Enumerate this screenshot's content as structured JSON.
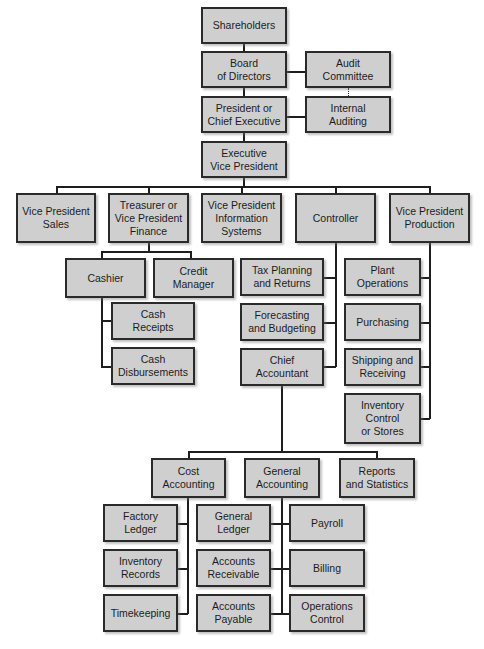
{
  "diagram": {
    "type": "organization-chart",
    "box_color": "#cfcfcf",
    "border_color": "#2a2a2a",
    "nodes": {
      "shareholders": "Shareholders",
      "board": "Board\nof Directors",
      "audit_committee": "Audit\nCommittee",
      "president": "President or\nChief Executive",
      "internal_auditing": "Internal\nAuditing",
      "exec_vp": "Executive\nVice President",
      "vp_sales": "Vice President\nSales",
      "treasurer": "Treasurer or\nVice President\nFinance",
      "vp_is": "Vice President\nInformation\nSystems",
      "controller": "Controller",
      "vp_production": "Vice President\nProduction",
      "cashier": "Cashier",
      "credit_manager": "Credit\nManager",
      "cash_receipts": "Cash\nReceipts",
      "cash_disbursements": "Cash\nDisbursements",
      "tax_planning": "Tax Planning\nand Returns",
      "forecasting": "Forecasting\nand Budgeting",
      "chief_accountant": "Chief\nAccountant",
      "plant_operations": "Plant\nOperations",
      "purchasing": "Purchasing",
      "shipping": "Shipping and\nReceiving",
      "inventory_control": "Inventory\nControl\nor Stores",
      "cost_accounting": "Cost\nAccounting",
      "general_accounting": "General\nAccounting",
      "reports": "Reports\nand Statistics",
      "factory_ledger": "Factory\nLedger",
      "inventory_records": "Inventory\nRecords",
      "timekeeping": "Timekeeping",
      "general_ledger": "General\nLedger",
      "accounts_receivable": "Accounts\nReceivable",
      "accounts_payable": "Accounts\nPayable",
      "payroll": "Payroll",
      "billing": "Billing",
      "operations_control": "Operations\nControl"
    },
    "edges": [
      [
        "Shareholders",
        "Board of Directors"
      ],
      [
        "Board of Directors",
        "Audit Committee"
      ],
      [
        "Board of Directors",
        "President or Chief Executive"
      ],
      [
        "Audit Committee",
        "Internal Auditing",
        "dotted"
      ],
      [
        "President or Chief Executive",
        "Internal Auditing"
      ],
      [
        "President or Chief Executive",
        "Executive Vice President"
      ],
      [
        "Executive Vice President",
        "Vice President Sales"
      ],
      [
        "Executive Vice President",
        "Treasurer or Vice President Finance"
      ],
      [
        "Executive Vice President",
        "Vice President Information Systems"
      ],
      [
        "Executive Vice President",
        "Controller"
      ],
      [
        "Executive Vice President",
        "Vice President Production"
      ],
      [
        "Treasurer or Vice President Finance",
        "Cashier"
      ],
      [
        "Treasurer or Vice President Finance",
        "Credit Manager"
      ],
      [
        "Cashier",
        "Cash Receipts"
      ],
      [
        "Cashier",
        "Cash Disbursements"
      ],
      [
        "Controller",
        "Tax Planning and Returns"
      ],
      [
        "Controller",
        "Forecasting and Budgeting"
      ],
      [
        "Controller",
        "Chief Accountant"
      ],
      [
        "Vice President Production",
        "Plant Operations"
      ],
      [
        "Vice President Production",
        "Purchasing"
      ],
      [
        "Vice President Production",
        "Shipping and Receiving"
      ],
      [
        "Vice President Production",
        "Inventory Control or Stores"
      ],
      [
        "Chief Accountant",
        "Cost Accounting"
      ],
      [
        "Chief Accountant",
        "General Accounting"
      ],
      [
        "Chief Accountant",
        "Reports and Statistics"
      ],
      [
        "Cost Accounting",
        "Factory Ledger"
      ],
      [
        "Cost Accounting",
        "Inventory Records"
      ],
      [
        "Cost Accounting",
        "Timekeeping"
      ],
      [
        "General Accounting",
        "General Ledger"
      ],
      [
        "General Accounting",
        "Accounts Receivable"
      ],
      [
        "General Accounting",
        "Accounts Payable"
      ],
      [
        "General Accounting",
        "Payroll"
      ],
      [
        "General Accounting",
        "Billing"
      ],
      [
        "General Accounting",
        "Operations Control"
      ]
    ]
  }
}
